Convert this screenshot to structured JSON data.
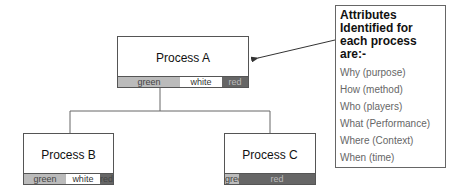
{
  "diagram": {
    "process_a": {
      "title": "Process A",
      "bar": [
        {
          "label": "green",
          "color": "green",
          "width": 62
        },
        {
          "label": "white",
          "color": "white",
          "width": 42
        },
        {
          "label": "red",
          "color": "red",
          "width": 26
        }
      ]
    },
    "process_b": {
      "title": "Process B",
      "bar": [
        {
          "label": "green",
          "color": "green",
          "width": 44
        },
        {
          "label": "white",
          "color": "white",
          "width": 36
        },
        {
          "label": "red",
          "color": "red",
          "width": 9
        }
      ]
    },
    "process_c": {
      "title": "Process C",
      "bar": [
        {
          "label": "green",
          "color": "green",
          "width": 14
        },
        {
          "label": "red",
          "color": "red",
          "width": 75
        }
      ]
    },
    "callout": {
      "title": "Attributes Identified for each process are:-",
      "items": [
        "Why (purpose)",
        "How (method)",
        "Who (players)",
        "What (Performance)",
        "Where (Context)",
        "When (time)"
      ]
    }
  }
}
